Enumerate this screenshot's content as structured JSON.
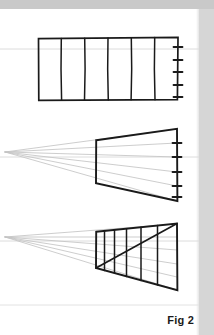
{
  "page": {
    "caption": "Fig 2",
    "background_color": "#ffffff",
    "margin_strip_color": "#c9c9c9",
    "ink_color": "#1a1a1a",
    "guide_color": "#cfcfcf"
  },
  "figure": {
    "title": "Fig 2",
    "panels": [
      {
        "id": "panel-flat-grid",
        "label": "flat rectangle with equal vertical divisions",
        "shape": "rectangle",
        "rect": {
          "x": 38,
          "y": 38,
          "width": 140,
          "height": 62
        },
        "division_count": 6,
        "interior_divider_x": [
          61.3,
          84.7,
          108.0,
          131.3,
          154.7
        ],
        "tick_count": 5,
        "tick_y": [
          47,
          60,
          72,
          85,
          97
        ],
        "tick_x": 178,
        "tick_length": 9
      },
      {
        "id": "panel-perspective-blank",
        "label": "perspective trapezoid with convergence rays",
        "shape": "trapezoid",
        "vanishing_point": {
          "x": 5,
          "y": 152
        },
        "corners": {
          "top_left": {
            "x": 96,
            "y": 140
          },
          "top_right": {
            "x": 177,
            "y": 129
          },
          "bottom_left": {
            "x": 96,
            "y": 183
          },
          "bottom_right": {
            "x": 177,
            "y": 201
          }
        },
        "ray_count": 6,
        "ray_end_y": [
          129,
          143,
          157,
          172,
          186,
          201
        ],
        "tick_count": 5,
        "tick_y": [
          143,
          157,
          172,
          186,
          197
        ],
        "tick_x": 177,
        "tick_length": 9
      },
      {
        "id": "panel-perspective-divided",
        "label": "perspective trapezoid divided by diagonal method",
        "shape": "trapezoid",
        "vanishing_point": {
          "x": 5,
          "y": 237
        },
        "corners": {
          "top_left": {
            "x": 96,
            "y": 232
          },
          "top_right": {
            "x": 177,
            "y": 224
          },
          "bottom_left": {
            "x": 96,
            "y": 268
          },
          "bottom_right": {
            "x": 177,
            "y": 290
          }
        },
        "ray_count": 6,
        "ray_end_y": [
          224,
          237,
          250,
          264,
          277,
          290
        ],
        "division_count": 6,
        "interior_divider_x": [
          104.5,
          114.5,
          126.5,
          141.0,
          157.5
        ],
        "diagonal": {
          "from": {
            "x": 96,
            "y": 268
          },
          "to": {
            "x": 177,
            "y": 224
          }
        }
      }
    ],
    "guide_lines": [
      {
        "id": "guide-top",
        "y": 49
      },
      {
        "id": "guide-middle",
        "y": 157
      },
      {
        "id": "guide-bottom",
        "y": 241
      },
      {
        "id": "guide-caption-rule",
        "y": 305
      }
    ]
  }
}
